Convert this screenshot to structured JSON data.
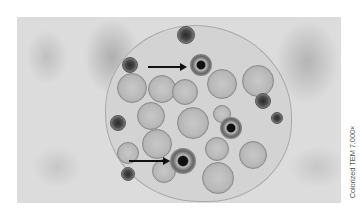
{
  "figure": {
    "caption": "Colorized TEM 7,000×",
    "arrows": [
      {
        "label": "arrow-upper",
        "points_to": "dark ringed body upper center"
      },
      {
        "label": "arrow-lower",
        "points_to": "dark ringed body lower center"
      }
    ],
    "colors": {
      "background": "#ffffff",
      "tissue": "#dcdcdc",
      "dark_body": "#2a2a2a",
      "caption_text": "#555555"
    }
  }
}
